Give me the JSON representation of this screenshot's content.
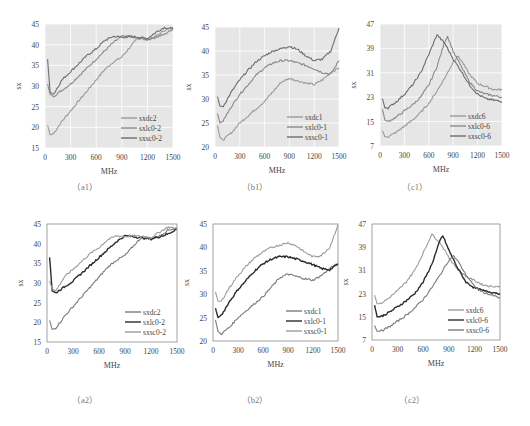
{
  "chart_data": [
    {
      "id": "a1",
      "caption": "（a1）",
      "type": "line",
      "style": "ggplot",
      "xlabel": "MHz",
      "ylabel": "sx",
      "xlim": [
        0,
        1500
      ],
      "ylim": [
        15,
        45
      ],
      "xticks": [
        0,
        300,
        600,
        900,
        1200,
        1500
      ],
      "yticks": [
        15,
        20,
        25,
        30,
        35,
        40,
        45
      ],
      "legend_position": "lower right",
      "series": [
        {
          "name": "sxdc2",
          "color": "#9a9a9a",
          "x": [
            30,
            60,
            100,
            200,
            300,
            400,
            500,
            600,
            700,
            800,
            900,
            1000,
            1100,
            1200,
            1300,
            1400,
            1500
          ],
          "y": [
            20.5,
            18.2,
            18.5,
            21.5,
            24.0,
            26.5,
            29.0,
            31.5,
            34.0,
            35.8,
            37.0,
            39.5,
            41.8,
            41.3,
            42.0,
            43.5,
            44.0
          ]
        },
        {
          "name": "sxlc0-2",
          "color": "#8a8a8a",
          "x": [
            30,
            60,
            100,
            200,
            300,
            400,
            500,
            600,
            700,
            800,
            900,
            1000,
            1100,
            1200,
            1300,
            1400,
            1500
          ],
          "y": [
            30.5,
            28.0,
            27.5,
            29.0,
            30.5,
            32.5,
            34.5,
            36.5,
            38.5,
            40.5,
            42.0,
            41.8,
            41.5,
            41.2,
            41.8,
            42.5,
            43.8
          ]
        },
        {
          "name": "sxsc0-2",
          "color": "#6e6e6e",
          "x": [
            30,
            60,
            100,
            200,
            300,
            400,
            500,
            600,
            700,
            800,
            900,
            1000,
            1100,
            1200,
            1300,
            1400,
            1500
          ],
          "y": [
            36.5,
            28.5,
            28.0,
            31.5,
            33.5,
            35.5,
            37.5,
            39.0,
            41.0,
            42.0,
            41.8,
            42.0,
            41.8,
            41.5,
            43.0,
            44.2,
            43.8
          ]
        }
      ]
    },
    {
      "id": "b1",
      "caption": "（b1）",
      "type": "line",
      "style": "ggplot",
      "xlabel": "MHz",
      "ylabel": "sx",
      "xlim": [
        0,
        1500
      ],
      "ylim": [
        20,
        45
      ],
      "xticks": [
        0,
        300,
        600,
        900,
        1200,
        1500
      ],
      "yticks": [
        20,
        25,
        30,
        35,
        40,
        45
      ],
      "legend_position": "lower right",
      "series": [
        {
          "name": "sxdc1",
          "color": "#9a9a9a",
          "x": [
            30,
            60,
            100,
            200,
            300,
            400,
            500,
            600,
            700,
            800,
            900,
            1000,
            1100,
            1200,
            1300,
            1400,
            1500
          ],
          "y": [
            24.5,
            22.0,
            21.5,
            23.0,
            25.0,
            26.5,
            28.0,
            29.5,
            31.5,
            33.5,
            34.3,
            33.8,
            33.3,
            33.0,
            34.0,
            35.5,
            36.5
          ]
        },
        {
          "name": "sxlc0-1",
          "color": "#8a8a8a",
          "x": [
            30,
            60,
            100,
            200,
            300,
            400,
            500,
            600,
            700,
            800,
            900,
            1000,
            1100,
            1200,
            1300,
            1400,
            1500
          ],
          "y": [
            27.0,
            25.0,
            25.5,
            28.5,
            31.0,
            33.0,
            35.0,
            36.5,
            37.5,
            38.0,
            38.0,
            37.5,
            37.0,
            36.3,
            35.5,
            35.2,
            38.0
          ]
        },
        {
          "name": "sxsc0-1",
          "color": "#6e6e6e",
          "x": [
            30,
            60,
            100,
            200,
            300,
            400,
            500,
            600,
            700,
            800,
            900,
            1000,
            1100,
            1200,
            1300,
            1400,
            1500
          ],
          "y": [
            30.5,
            28.5,
            28.5,
            31.5,
            34.0,
            36.0,
            37.8,
            39.0,
            40.0,
            40.5,
            41.0,
            40.3,
            39.0,
            38.0,
            38.3,
            40.0,
            44.8
          ]
        }
      ]
    },
    {
      "id": "c1",
      "caption": "（c1）",
      "type": "line",
      "style": "ggplot",
      "xlabel": "MHz",
      "ylabel": "sx",
      "xlim": [
        0,
        1500
      ],
      "ylim": [
        7,
        47
      ],
      "xticks": [
        0,
        300,
        600,
        900,
        1200,
        1500
      ],
      "yticks": [
        7,
        15,
        23,
        31,
        39,
        47
      ],
      "legend_position": "lower right",
      "series": [
        {
          "name": "sxdc6",
          "color": "#9a9a9a",
          "x": [
            30,
            60,
            100,
            200,
            300,
            400,
            500,
            600,
            700,
            800,
            900,
            950,
            1000,
            1100,
            1200,
            1300,
            1400,
            1500
          ],
          "y": [
            12.0,
            10.0,
            10.0,
            11.5,
            13.5,
            15.5,
            18.0,
            21.0,
            25.0,
            29.5,
            34.5,
            36.5,
            35.0,
            30.5,
            27.5,
            26.5,
            25.5,
            25.5
          ]
        },
        {
          "name": "sxlc0-6",
          "color": "#8a8a8a",
          "x": [
            30,
            60,
            100,
            200,
            300,
            400,
            500,
            600,
            700,
            800,
            830,
            900,
            1000,
            1100,
            1200,
            1300,
            1400,
            1500
          ],
          "y": [
            19.0,
            15.5,
            15.0,
            16.5,
            18.5,
            20.5,
            23.0,
            27.0,
            33.0,
            41.5,
            43.0,
            38.0,
            33.0,
            28.0,
            25.0,
            24.0,
            23.5,
            23.0
          ]
        },
        {
          "name": "sxsc0-6",
          "color": "#6e6e6e",
          "x": [
            30,
            60,
            100,
            200,
            300,
            400,
            500,
            600,
            700,
            800,
            900,
            1000,
            1100,
            1200,
            1300,
            1400,
            1500
          ],
          "y": [
            22.5,
            19.5,
            19.5,
            21.5,
            24.0,
            27.0,
            31.0,
            37.0,
            43.5,
            40.5,
            35.5,
            31.5,
            27.0,
            24.0,
            22.5,
            22.0,
            21.5
          ]
        }
      ]
    },
    {
      "id": "a2",
      "caption": "（a2）",
      "type": "line",
      "style": "boxed",
      "xlabel": "MHz",
      "ylabel": "sx",
      "xlim": [
        0,
        1500
      ],
      "ylim": [
        15,
        45
      ],
      "xticks": [
        0,
        300,
        600,
        900,
        1200,
        1500
      ],
      "yticks": [
        15,
        20,
        25,
        30,
        35,
        40,
        45
      ],
      "legend_position": "lower right",
      "series": [
        {
          "name": "sxdc2",
          "color": "#7a7a7a",
          "x": [
            30,
            60,
            100,
            200,
            300,
            400,
            500,
            600,
            700,
            800,
            900,
            1000,
            1100,
            1200,
            1300,
            1400,
            1500
          ],
          "y": [
            20.5,
            18.2,
            18.5,
            21.5,
            24.0,
            26.5,
            29.0,
            31.5,
            34.0,
            35.8,
            37.0,
            39.5,
            41.8,
            41.3,
            42.0,
            43.5,
            44.0
          ]
        },
        {
          "name": "sxlc0-2",
          "color": "#2b2b2b",
          "x": [
            30,
            60,
            100,
            200,
            300,
            400,
            500,
            600,
            700,
            800,
            900,
            1000,
            1100,
            1200,
            1300,
            1400,
            1500
          ],
          "y": [
            36.5,
            28.0,
            27.5,
            29.0,
            30.5,
            32.5,
            34.5,
            36.5,
            38.5,
            40.5,
            42.0,
            41.8,
            41.5,
            41.2,
            41.8,
            42.5,
            43.8
          ]
        },
        {
          "name": "sxsc0-2",
          "color": "#9c9c9c",
          "x": [
            30,
            60,
            100,
            200,
            300,
            400,
            500,
            600,
            700,
            800,
            900,
            1000,
            1100,
            1200,
            1300,
            1400,
            1500
          ],
          "y": [
            30.5,
            28.5,
            28.0,
            31.5,
            33.5,
            35.5,
            37.5,
            39.0,
            41.0,
            42.0,
            41.8,
            42.0,
            41.8,
            41.5,
            43.0,
            44.2,
            43.8
          ]
        }
      ]
    },
    {
      "id": "b2",
      "caption": "（b2）",
      "type": "line",
      "style": "boxed",
      "xlabel": "MHz",
      "ylabel": "sx",
      "xlim": [
        0,
        1500
      ],
      "ylim": [
        20,
        45
      ],
      "xticks": [
        0,
        300,
        600,
        900,
        1200,
        1500
      ],
      "yticks": [
        20,
        25,
        30,
        35,
        40,
        45
      ],
      "legend_position": "lower right",
      "series": [
        {
          "name": "sxdc1",
          "color": "#7a7a7a",
          "x": [
            30,
            60,
            100,
            200,
            300,
            400,
            500,
            600,
            700,
            800,
            900,
            1000,
            1100,
            1200,
            1300,
            1400,
            1500
          ],
          "y": [
            24.5,
            22.0,
            21.5,
            23.0,
            25.0,
            26.5,
            28.0,
            29.5,
            31.5,
            33.5,
            34.3,
            33.8,
            33.3,
            33.0,
            34.0,
            35.5,
            36.5
          ]
        },
        {
          "name": "sxlc0-1",
          "color": "#2b2b2b",
          "x": [
            30,
            60,
            100,
            200,
            300,
            400,
            500,
            600,
            700,
            800,
            900,
            1000,
            1100,
            1200,
            1300,
            1400,
            1500
          ],
          "y": [
            27.0,
            25.0,
            25.5,
            28.5,
            31.0,
            33.0,
            35.0,
            36.5,
            37.5,
            38.0,
            38.0,
            37.5,
            37.0,
            36.3,
            35.5,
            35.2,
            36.5
          ]
        },
        {
          "name": "sxsc0-1",
          "color": "#9c9c9c",
          "x": [
            30,
            60,
            100,
            200,
            300,
            400,
            500,
            600,
            700,
            800,
            900,
            1000,
            1100,
            1200,
            1300,
            1400,
            1500
          ],
          "y": [
            30.5,
            28.5,
            28.5,
            31.5,
            34.0,
            36.0,
            37.8,
            39.0,
            40.0,
            40.5,
            41.0,
            40.3,
            39.0,
            38.0,
            38.3,
            40.0,
            44.8
          ]
        }
      ]
    },
    {
      "id": "c2",
      "caption": "（c2）",
      "type": "line",
      "style": "boxed",
      "xlabel": "MHz",
      "ylabel": "sx",
      "xlim": [
        0,
        1500
      ],
      "ylim": [
        7,
        47
      ],
      "xticks": [
        0,
        300,
        600,
        900,
        1200,
        1500
      ],
      "yticks": [
        7,
        15,
        23,
        31,
        39,
        47
      ],
      "legend_position": "lower right",
      "series": [
        {
          "name": "sxdc6",
          "color": "#9c9c9c",
          "x": [
            30,
            60,
            100,
            200,
            300,
            400,
            500,
            600,
            700,
            800,
            900,
            1000,
            1100,
            1200,
            1300,
            1400,
            1500
          ],
          "y": [
            22.5,
            19.5,
            19.5,
            21.5,
            24.0,
            27.0,
            31.0,
            37.0,
            43.5,
            40.5,
            35.5,
            31.5,
            29.0,
            27.5,
            26.0,
            25.5,
            25.5
          ]
        },
        {
          "name": "sxlc0-6",
          "color": "#2b2b2b",
          "x": [
            30,
            60,
            100,
            200,
            300,
            400,
            500,
            600,
            700,
            800,
            830,
            900,
            1000,
            1100,
            1200,
            1300,
            1400,
            1500
          ],
          "y": [
            19.0,
            15.0,
            15.0,
            16.5,
            18.5,
            20.5,
            23.0,
            27.0,
            33.0,
            41.5,
            43.0,
            38.0,
            32.0,
            27.0,
            25.0,
            24.0,
            23.5,
            23.0
          ]
        },
        {
          "name": "sxsc0-6",
          "color": "#7a7a7a",
          "x": [
            30,
            60,
            100,
            200,
            300,
            400,
            500,
            600,
            700,
            800,
            900,
            950,
            1000,
            1100,
            1200,
            1300,
            1400,
            1500
          ],
          "y": [
            12.0,
            10.0,
            10.0,
            11.5,
            13.5,
            15.5,
            18.0,
            21.0,
            25.0,
            29.5,
            34.5,
            36.0,
            34.5,
            29.5,
            25.5,
            23.5,
            22.5,
            21.5
          ]
        }
      ]
    }
  ],
  "layout": {
    "panels": [
      {
        "id": "a1",
        "plot": [
          45,
          24,
          128,
          124
        ],
        "caption_x": 85,
        "caption_y": 190
      },
      {
        "id": "b1",
        "plot": [
          215,
          27,
          124,
          120
        ],
        "caption_x": 255,
        "caption_y": 190
      },
      {
        "id": "c1",
        "plot": [
          380,
          24,
          122,
          122
        ],
        "caption_x": 415,
        "caption_y": 190
      },
      {
        "id": "a2",
        "plot": [
          47,
          224,
          130,
          118
        ],
        "caption_x": 85,
        "caption_y": 403
      },
      {
        "id": "b2",
        "plot": [
          213,
          224,
          125,
          117
        ],
        "caption_x": 255,
        "caption_y": 403
      },
      {
        "id": "c2",
        "plot": [
          372,
          224,
          128,
          116
        ],
        "caption_x": 412,
        "caption_y": 403
      }
    ]
  }
}
